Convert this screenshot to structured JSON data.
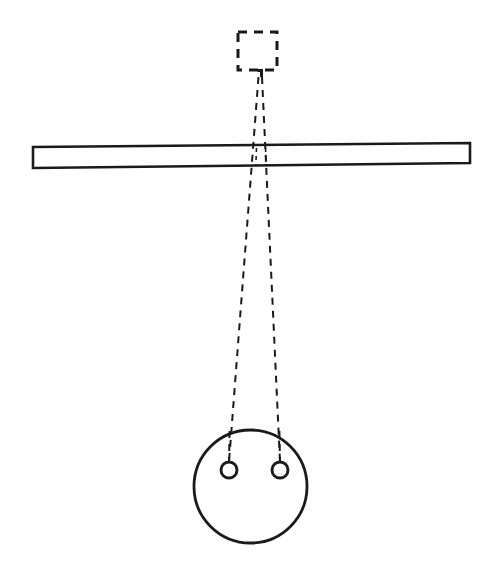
{
  "figure": {
    "background_color": "#ffffff",
    "stroke_color": "#1a1a1a",
    "width": 494,
    "height": 570
  },
  "elements": {
    "virtual_object": {
      "name": "dashed-square",
      "label": "",
      "shape": "square",
      "style": "dashed",
      "x": 238,
      "y": 32,
      "width": 39,
      "height": 38,
      "stroke_width": 3,
      "dash_pattern": "9 7"
    },
    "notch": {
      "name": "apex-notch",
      "label": "",
      "x": 258,
      "y": 70,
      "width": 5,
      "height": 6,
      "stroke_width": 3
    },
    "bar": {
      "name": "tilted-bar",
      "label": "",
      "shape": "parallelogram",
      "style": "solid",
      "stroke_width": 2.6,
      "left_x": 33,
      "right_x": 470,
      "left_top_y": 147,
      "right_top_y": 143,
      "left_bottom_y": 168,
      "right_bottom_y": 163
    },
    "big_circle": {
      "name": "large-circle",
      "label": "",
      "shape": "circle",
      "style": "solid",
      "cx": 250.5,
      "cy": 486.5,
      "r": 56.5,
      "stroke_width": 2.8
    },
    "small_circle_left": {
      "name": "small-circle-left",
      "label": "",
      "shape": "circle",
      "style": "solid",
      "cx": 229,
      "cy": 470,
      "r": 8,
      "stroke_width": 2.8
    },
    "small_circle_right": {
      "name": "small-circle-right",
      "label": "",
      "shape": "circle",
      "style": "solid",
      "cx": 280,
      "cy": 470,
      "r": 8,
      "stroke_width": 2.8
    },
    "ray_left": {
      "name": "ray-line-left",
      "label": "",
      "style": "dashed",
      "x1": 259,
      "y1": 76,
      "x2": 229,
      "y2": 462,
      "stroke_width": 2,
      "dash_pattern": "7 6"
    },
    "ray_right": {
      "name": "ray-line-right",
      "label": "",
      "style": "dashed",
      "x1": 262,
      "y1": 76,
      "x2": 280,
      "y2": 462,
      "stroke_width": 2,
      "dash_pattern": "7 6"
    }
  }
}
